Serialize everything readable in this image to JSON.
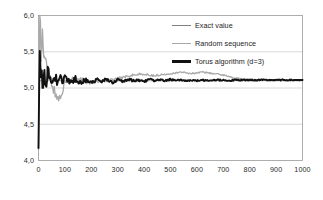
{
  "chart_data": {
    "type": "line",
    "title": "",
    "xlabel": "",
    "ylabel": "",
    "xlim": [
      0,
      1000
    ],
    "ylim": [
      4.0,
      6.0
    ],
    "grid": true,
    "gridlines_y": [
      4.5,
      5.0,
      5.5
    ],
    "legend_position": "top-right-inside",
    "y_ticks": [
      4.0,
      4.5,
      5.0,
      5.5,
      6.0
    ],
    "y_tick_labels": [
      "4,0",
      "4,5",
      "5,0",
      "5,5",
      "6,0"
    ],
    "x_ticks": [
      0,
      100,
      200,
      300,
      400,
      500,
      600,
      700,
      800,
      900,
      1000
    ],
    "x_tick_labels": [
      "0",
      "100",
      "200",
      "300",
      "400",
      "500",
      "600",
      "700",
      "800",
      "900",
      "1000"
    ],
    "series": [
      {
        "name": "Exact value",
        "color": "#808080",
        "width": 0.7,
        "style": "constant",
        "value": 5.1,
        "x": [
          0,
          1000
        ],
        "values": [
          5.1,
          5.1
        ]
      },
      {
        "name": "Random sequence",
        "color": "#a9a9a9",
        "width": 1.3,
        "style": "noisy",
        "x": [
          0,
          5,
          10,
          15,
          20,
          25,
          30,
          35,
          40,
          45,
          50,
          60,
          70,
          80,
          90,
          100,
          120,
          140,
          160,
          180,
          200,
          220,
          240,
          260,
          280,
          300,
          320,
          340,
          360,
          380,
          400,
          420,
          440,
          460,
          480,
          500,
          520,
          540,
          560,
          580,
          600,
          620,
          640,
          660,
          680,
          700,
          720,
          740,
          760,
          780,
          800,
          820,
          840,
          860,
          880,
          900,
          920,
          940,
          960,
          980,
          1000
        ],
        "values": [
          4.02,
          5.92,
          5.55,
          5.74,
          5.46,
          5.38,
          5.3,
          5.26,
          5.2,
          5.14,
          5.1,
          4.95,
          4.84,
          4.88,
          4.97,
          5.04,
          5.1,
          5.13,
          5.12,
          5.09,
          5.08,
          5.09,
          5.11,
          5.1,
          5.12,
          5.13,
          5.15,
          5.17,
          5.18,
          5.19,
          5.19,
          5.18,
          5.17,
          5.18,
          5.19,
          5.2,
          5.21,
          5.22,
          5.21,
          5.2,
          5.21,
          5.22,
          5.21,
          5.2,
          5.19,
          5.18,
          5.16,
          5.14,
          5.13,
          5.12,
          5.12,
          5.11,
          5.12,
          5.11,
          5.11,
          5.11,
          5.12,
          5.11,
          5.11,
          5.11,
          5.11
        ]
      },
      {
        "name": "Torus algorithm (d=3)",
        "color": "#111111",
        "width": 1.9,
        "style": "noisy",
        "x": [
          0,
          5,
          10,
          15,
          20,
          25,
          30,
          35,
          40,
          45,
          50,
          60,
          70,
          80,
          90,
          100,
          120,
          140,
          160,
          180,
          200,
          220,
          240,
          260,
          280,
          300,
          320,
          340,
          360,
          380,
          400,
          420,
          440,
          460,
          480,
          500,
          520,
          540,
          560,
          580,
          600,
          620,
          640,
          660,
          680,
          700,
          720,
          740,
          760,
          780,
          800,
          820,
          840,
          860,
          880,
          900,
          920,
          940,
          960,
          980,
          1000
        ],
        "values": [
          4.0,
          5.6,
          5.35,
          5.12,
          5.08,
          5.18,
          5.06,
          5.2,
          5.11,
          5.22,
          5.12,
          5.18,
          5.08,
          5.16,
          5.07,
          5.14,
          5.08,
          5.13,
          5.07,
          5.12,
          5.08,
          5.11,
          5.09,
          5.12,
          5.08,
          5.11,
          5.09,
          5.12,
          5.1,
          5.11,
          5.09,
          5.12,
          5.1,
          5.11,
          5.1,
          5.12,
          5.1,
          5.11,
          5.1,
          5.11,
          5.1,
          5.11,
          5.1,
          5.11,
          5.11,
          5.11,
          5.1,
          5.11,
          5.11,
          5.11,
          5.11,
          5.11,
          5.11,
          5.11,
          5.11,
          5.11,
          5.11,
          5.11,
          5.11,
          5.11,
          5.11
        ]
      }
    ]
  },
  "legend": {
    "items": [
      {
        "label": "Exact value"
      },
      {
        "label": "Random sequence"
      },
      {
        "label": "Torus algorithm (d=3)"
      }
    ]
  },
  "axes": {
    "y_labels": [
      "6,0",
      "5,5",
      "5,0",
      "4,5",
      "4,0"
    ],
    "x_labels": [
      "0",
      "100",
      "200",
      "300",
      "400",
      "500",
      "600",
      "700",
      "800",
      "900",
      "1000"
    ]
  }
}
